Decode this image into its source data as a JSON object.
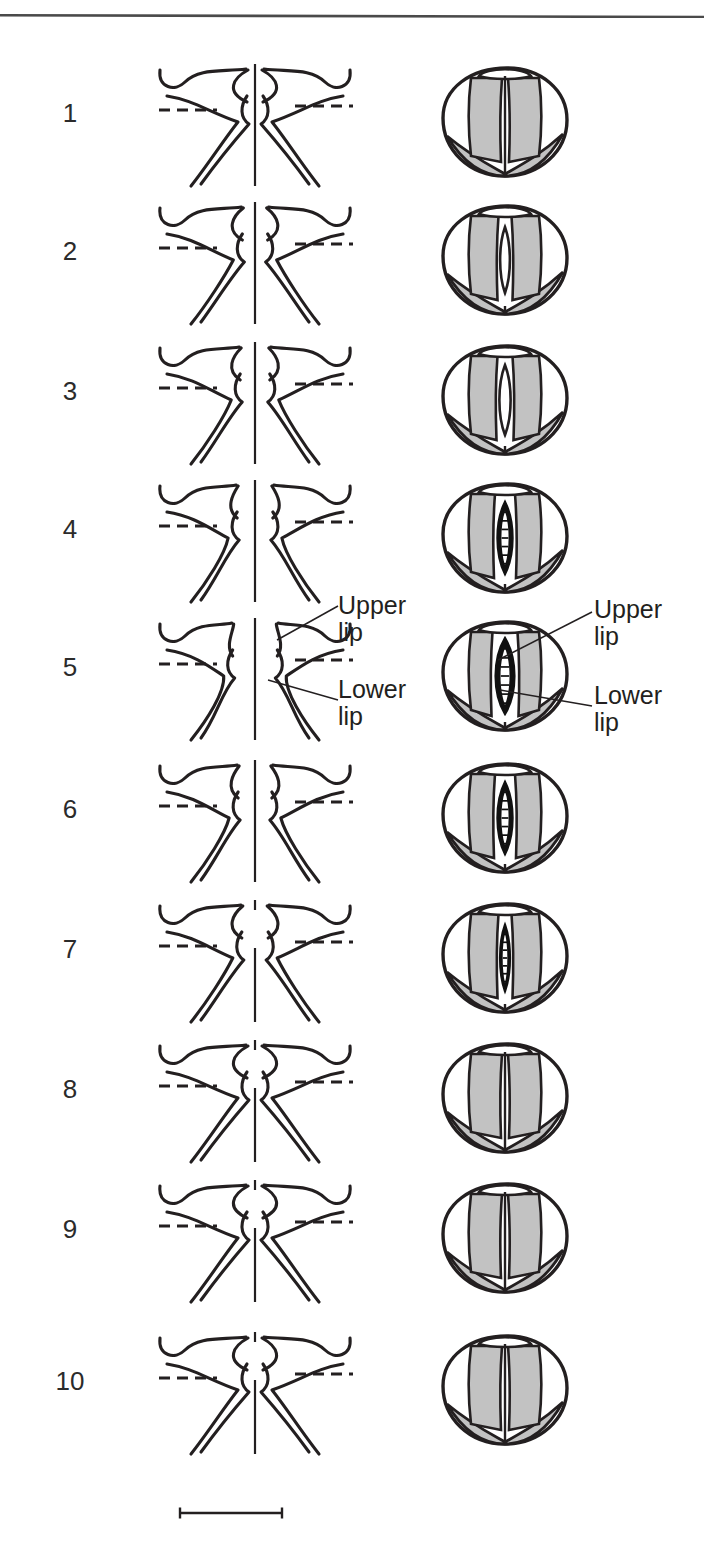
{
  "figure": {
    "kind": "scientific-illustration",
    "left_column_view": "coronal cross-section",
    "right_column_view": "superior laryngoscopic view",
    "top_rule": true,
    "scale_bar": {
      "present": true,
      "label": "",
      "x": 177,
      "y": 1513,
      "length": 100
    },
    "colors": {
      "ink": "#231f20",
      "number_ink": "#2b2b2b",
      "tissue_gray": "#c2c2c2",
      "glottis_dark": "#111111",
      "paper": "#ffffff",
      "rule": "#4a4a4a"
    }
  },
  "annotations": {
    "left_upper_lip": "Upper\nlip",
    "left_lower_lip": "Lower\nlip",
    "right_upper_lip": "Upper\nlip",
    "right_lower_lip": "Lower\nlip"
  },
  "chart_data": {
    "type": "table",
    "title": "",
    "xlabel": "",
    "ylabel": "",
    "categories": [
      "1",
      "2",
      "3",
      "4",
      "5",
      "6",
      "7",
      "8",
      "9",
      "10"
    ],
    "series": [
      {
        "name": "glottal_opening_relative_width",
        "values": [
          0.0,
          0.22,
          0.3,
          0.45,
          0.62,
          0.42,
          0.26,
          0.0,
          0.0,
          0.0
        ]
      },
      {
        "name": "opening_darkness",
        "values": [
          0.0,
          0.1,
          0.15,
          0.7,
          0.95,
          0.9,
          0.8,
          0.0,
          0.0,
          0.0
        ]
      }
    ],
    "rows": [
      {
        "n": "1",
        "phase": "closed",
        "fold_gap": 0.0,
        "open_kind": "none",
        "open_w": 0,
        "open_h": 0,
        "midline": "solid",
        "lens": "closed"
      },
      {
        "n": "2",
        "phase": "opening",
        "fold_gap": 0.18,
        "open_kind": "light-lens",
        "open_w": 13,
        "open_h": 66,
        "midline": "solid",
        "lens": "white"
      },
      {
        "n": "3",
        "phase": "opening",
        "fold_gap": 0.26,
        "open_kind": "light-lens",
        "open_w": 15,
        "open_h": 70,
        "midline": "solid",
        "lens": "white"
      },
      {
        "n": "4",
        "phase": "opening",
        "fold_gap": 0.38,
        "open_kind": "dark-lens",
        "open_w": 20,
        "open_h": 72,
        "midline": "solid",
        "lens": "dark-dashed"
      },
      {
        "n": "5",
        "phase": "maximum-open",
        "fold_gap": 0.55,
        "open_kind": "dark-lens",
        "open_w": 25,
        "open_h": 76,
        "midline": "solid",
        "lens": "dark-dashed"
      },
      {
        "n": "6",
        "phase": "closing",
        "fold_gap": 0.34,
        "open_kind": "dark-lens",
        "open_w": 20,
        "open_h": 72,
        "midline": "solid",
        "lens": "dark-dashed"
      },
      {
        "n": "7",
        "phase": "closing",
        "fold_gap": 0.2,
        "open_kind": "dark-slit",
        "open_w": 13,
        "open_h": 66,
        "midline": "dashed",
        "lens": "dark-dashed"
      },
      {
        "n": "8",
        "phase": "closed",
        "fold_gap": 0.0,
        "open_kind": "none",
        "open_w": 0,
        "open_h": 0,
        "midline": "dashed",
        "lens": "closed"
      },
      {
        "n": "9",
        "phase": "closed",
        "fold_gap": 0.0,
        "open_kind": "none",
        "open_w": 0,
        "open_h": 0,
        "midline": "dashed",
        "lens": "closed"
      },
      {
        "n": "10",
        "phase": "closed",
        "fold_gap": 0.0,
        "open_kind": "none",
        "open_w": 0,
        "open_h": 0,
        "midline": "dashed",
        "lens": "closed"
      }
    ],
    "row_tops": [
      52,
      190,
      330,
      468,
      606,
      748,
      888,
      1028,
      1168,
      1320
    ],
    "legend": [
      "Upper lip",
      "Lower lip"
    ],
    "grid": false,
    "legend_position": "inline-callouts-row-5"
  }
}
